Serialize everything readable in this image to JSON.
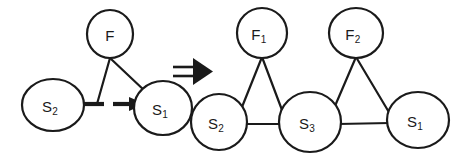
{
  "figure": {
    "background_color": "#ffffff",
    "stroke_color": "#1a1a1a",
    "relation_symbol": "implies-double-arrow",
    "relation_symbol_glyph": "⇒"
  },
  "left_graph": {
    "name": "before-transformation-graph",
    "nodes": [
      {
        "id": "F",
        "base": "F",
        "sub": "",
        "cx": 110,
        "cy": 34,
        "rx": 23,
        "ry": 24,
        "type": "factor-node"
      },
      {
        "id": "S2",
        "base": "S",
        "sub": "2",
        "cx": 53,
        "cy": 105,
        "rx": 31,
        "ry": 26,
        "type": "state-node"
      },
      {
        "id": "S1",
        "base": "S",
        "sub": "1",
        "cx": 163,
        "cy": 108,
        "rx": 29,
        "ry": 27,
        "type": "state-node"
      }
    ],
    "edges": [
      {
        "from": "F",
        "to": "S2",
        "style": "solid"
      },
      {
        "from": "F",
        "to": "S1",
        "style": "solid"
      },
      {
        "from": "S2",
        "to": "S1",
        "style": "dashed-arrow"
      }
    ]
  },
  "right_graph": {
    "name": "after-transformation-graph",
    "nodes": [
      {
        "id": "F1",
        "base": "F",
        "sub": "1",
        "cx": 262,
        "cy": 33,
        "rx": 25,
        "ry": 25,
        "type": "factor-node"
      },
      {
        "id": "F2",
        "base": "F",
        "sub": "2",
        "cx": 356,
        "cy": 33,
        "rx": 27,
        "ry": 25,
        "type": "factor-node"
      },
      {
        "id": "S2",
        "base": "S",
        "sub": "2",
        "cx": 219,
        "cy": 122,
        "rx": 28,
        "ry": 28,
        "type": "state-node"
      },
      {
        "id": "S3",
        "base": "S",
        "sub": "3",
        "cx": 310,
        "cy": 122,
        "rx": 31,
        "ry": 30,
        "type": "state-node"
      },
      {
        "id": "S1",
        "base": "S",
        "sub": "1",
        "cx": 418,
        "cy": 120,
        "rx": 31,
        "ry": 28,
        "type": "state-node"
      }
    ],
    "edges": [
      {
        "from": "F1",
        "to": "S2",
        "style": "solid"
      },
      {
        "from": "F1",
        "to": "S3",
        "style": "solid"
      },
      {
        "from": "S2",
        "to": "S3",
        "style": "solid"
      },
      {
        "from": "F2",
        "to": "S3",
        "style": "solid"
      },
      {
        "from": "F2",
        "to": "S1",
        "style": "solid"
      },
      {
        "from": "S3",
        "to": "S1",
        "style": "solid"
      }
    ]
  },
  "labels": {
    "lF": "F",
    "lF_sub": "",
    "lS2_left": "S",
    "lS2_left_sub": "2",
    "lS1_left": "S",
    "lS1_left_sub": "1",
    "rF1": "F",
    "rF1_sub": "1",
    "rF2": "F",
    "rF2_sub": "2",
    "rS2": "S",
    "rS2_sub": "2",
    "rS3": "S",
    "rS3_sub": "3",
    "rS1": "S",
    "rS1_sub": "1"
  }
}
